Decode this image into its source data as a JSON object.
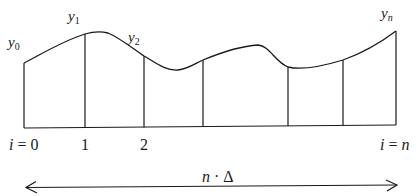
{
  "diagram": {
    "labels": {
      "y0": "y",
      "y0_sub": "0",
      "y1": "y",
      "y1_sub": "1",
      "y2": "y",
      "y2_sub": "2",
      "yn": "y",
      "yn_sub": "n",
      "i_start_var": "i",
      "i_start_eq": " = 0",
      "tick1": "1",
      "tick2": "2",
      "i_end_var": "i",
      "i_end_eq": " = ",
      "i_end_n": "n",
      "width_n": "n",
      "width_dot": " · ",
      "width_delta": "Δ"
    },
    "stroke_color": "#1a1a1a",
    "vertical_lines_x": [
      24,
      85,
      144,
      203,
      288,
      343,
      396
    ],
    "arrow_label": "n · Δ"
  }
}
